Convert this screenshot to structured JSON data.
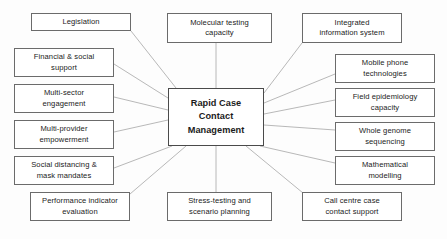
{
  "diagram": {
    "title": "Rapid Case Contact Management",
    "type": "hub-and-spoke concept map",
    "style": {
      "box_border_color": "#6b6b6b",
      "box_fill_color": "#ffffff",
      "connector_color": "#b0b0b0",
      "text_color": "#1b1b1b",
      "background_color": "#fdfdfd"
    },
    "center": {
      "id": "center",
      "label": "Rapid Case\nContact\nManagement",
      "x": 168,
      "y": 88,
      "w": 96,
      "h": 58,
      "bold": true
    },
    "nodes": [
      {
        "id": "legislation",
        "label": "Legislation",
        "x": 31,
        "y": 13,
        "w": 100,
        "h": 18,
        "anchor": "right"
      },
      {
        "id": "financial-social",
        "label": "Financial & social\nsupport",
        "x": 14,
        "y": 48,
        "w": 100,
        "h": 29,
        "anchor": "right"
      },
      {
        "id": "multi-sector",
        "label": "Multi-sector\nengagement",
        "x": 14,
        "y": 84,
        "w": 100,
        "h": 29,
        "anchor": "right"
      },
      {
        "id": "multi-provider",
        "label": "Multi-provider\nempowerment",
        "x": 14,
        "y": 120,
        "w": 100,
        "h": 29,
        "anchor": "right"
      },
      {
        "id": "social-distancing",
        "label": "Social distancing &\nmask mandates",
        "x": 14,
        "y": 156,
        "w": 100,
        "h": 29,
        "anchor": "right"
      },
      {
        "id": "performance",
        "label": "Performance indicator\nevaluation",
        "x": 30,
        "y": 192,
        "w": 100,
        "h": 29,
        "anchor": "right"
      },
      {
        "id": "molecular",
        "label": "Molecular testing\ncapacity",
        "x": 167,
        "y": 13,
        "w": 105,
        "h": 30,
        "anchor": "bottom"
      },
      {
        "id": "stress-testing",
        "label": "Stress-testing and\nscenario planning",
        "x": 167,
        "y": 192,
        "w": 105,
        "h": 29,
        "anchor": "top"
      },
      {
        "id": "integrated-info",
        "label": "Integrated\ninformation system",
        "x": 302,
        "y": 13,
        "w": 100,
        "h": 30,
        "anchor": "left"
      },
      {
        "id": "mobile-phone",
        "label": "Mobile phone\ntechnologies",
        "x": 335,
        "y": 54,
        "w": 100,
        "h": 29,
        "anchor": "left"
      },
      {
        "id": "field-epidemiology",
        "label": "Field epidemiology\ncapacity",
        "x": 335,
        "y": 88,
        "w": 100,
        "h": 29,
        "anchor": "left"
      },
      {
        "id": "whole-genome",
        "label": "Whole genome\nsequencing",
        "x": 335,
        "y": 122,
        "w": 100,
        "h": 29,
        "anchor": "left"
      },
      {
        "id": "mathematical",
        "label": "Mathematical\nmodelling",
        "x": 335,
        "y": 156,
        "w": 100,
        "h": 29,
        "anchor": "left"
      },
      {
        "id": "call-centre",
        "label": "Call centre case\ncontact support",
        "x": 302,
        "y": 192,
        "w": 100,
        "h": 29,
        "anchor": "left"
      }
    ],
    "connectors": [
      {
        "from": "legislation",
        "to": "center",
        "x1": 131,
        "y1": 31,
        "x2": 176,
        "y2": 88
      },
      {
        "from": "financial-social",
        "to": "center",
        "x1": 114,
        "y1": 64,
        "x2": 168,
        "y2": 98
      },
      {
        "from": "multi-sector",
        "to": "center",
        "x1": 114,
        "y1": 97,
        "x2": 168,
        "y2": 110
      },
      {
        "from": "multi-provider",
        "to": "center",
        "x1": 114,
        "y1": 132,
        "x2": 168,
        "y2": 120
      },
      {
        "from": "social-distancing",
        "to": "center",
        "x1": 114,
        "y1": 168,
        "x2": 172,
        "y2": 146
      },
      {
        "from": "performance",
        "to": "center",
        "x1": 130,
        "y1": 194,
        "x2": 186,
        "y2": 146
      },
      {
        "from": "molecular",
        "to": "center",
        "x1": 216,
        "y1": 43,
        "x2": 216,
        "y2": 88
      },
      {
        "from": "stress-testing",
        "to": "center",
        "x1": 216,
        "y1": 192,
        "x2": 216,
        "y2": 146
      },
      {
        "from": "integrated-info",
        "to": "center",
        "x1": 302,
        "y1": 43,
        "x2": 264,
        "y2": 93
      },
      {
        "from": "mobile-phone",
        "to": "center",
        "x1": 335,
        "y1": 74,
        "x2": 264,
        "y2": 103
      },
      {
        "from": "field-epidemiology",
        "to": "center",
        "x1": 335,
        "y1": 100,
        "x2": 264,
        "y2": 114
      },
      {
        "from": "whole-genome",
        "to": "center",
        "x1": 335,
        "y1": 130,
        "x2": 264,
        "y2": 125
      },
      {
        "from": "mathematical",
        "to": "center",
        "x1": 335,
        "y1": 163,
        "x2": 260,
        "y2": 146
      },
      {
        "from": "call-centre",
        "to": "center",
        "x1": 303,
        "y1": 193,
        "x2": 246,
        "y2": 146
      }
    ]
  }
}
